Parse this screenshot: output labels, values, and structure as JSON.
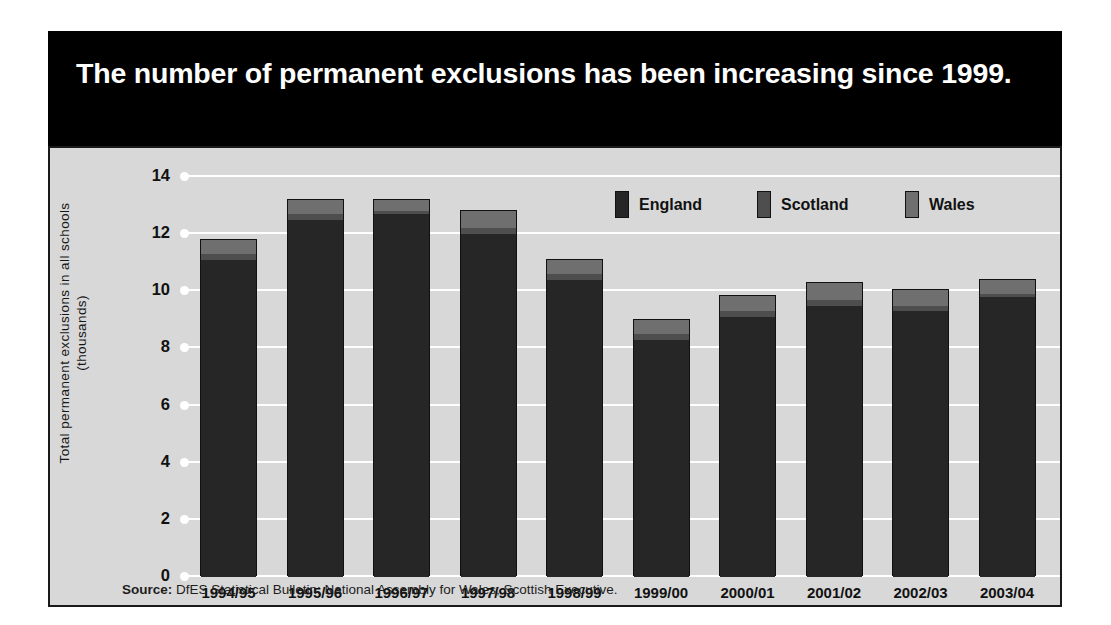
{
  "title": "The number of permanent exclusions has been increasing since 1999.",
  "source_label": "Source:",
  "source_text": " DfES Statistical Bulletin; National Assembly for Wales; Scottish Executive.",
  "legend": {
    "items": [
      {
        "label": "England",
        "color": "#262626",
        "swatch_name": "legend-swatch-england"
      },
      {
        "label": "Scotland",
        "color": "#4e4e4e",
        "swatch_name": "legend-swatch-scotland"
      },
      {
        "label": "Wales",
        "color": "#6f6f6f",
        "swatch_name": "legend-swatch-wales"
      }
    ]
  },
  "colors": {
    "title_band": "#000000",
    "panel_background": "#d8d8d8",
    "gridline": "#ffffff",
    "england": "#262626",
    "scotland": "#4e4e4e",
    "wales": "#6f6f6f",
    "outline": "#111111"
  },
  "chart_data": {
    "type": "bar",
    "title": "The number of permanent exclusions has been increasing since 1999.",
    "subtitle": "",
    "xlabel": "",
    "ylabel": "Total permanent exclusions in all schools (thousands)",
    "ylabel_line1": "Total permanent exclusions in all schools",
    "ylabel_line2": "(thousands)",
    "stacked": true,
    "grid": true,
    "legend_position": "top-right",
    "ylim": [
      0,
      14
    ],
    "yticks": [
      0,
      2,
      4,
      6,
      8,
      10,
      12,
      14
    ],
    "ytick_labels": [
      "0",
      "2",
      "4",
      "6",
      "8",
      "10",
      "12",
      "14"
    ],
    "categories": [
      "1994/95",
      "1995/96",
      "1996/97",
      "1997/98",
      "1998/99",
      "1999/00",
      "2000/01",
      "2001/02",
      "2002/03",
      "2003/04"
    ],
    "series": [
      {
        "name": "England",
        "color": "#262626",
        "values": [
          11.1,
          12.5,
          12.7,
          12.0,
          10.4,
          8.3,
          9.1,
          9.5,
          9.3,
          9.8
        ]
      },
      {
        "name": "Scotland",
        "color": "#4e4e4e",
        "values": [
          0.2,
          0.2,
          0.1,
          0.2,
          0.2,
          0.2,
          0.2,
          0.2,
          0.2,
          0.1
        ]
      },
      {
        "name": "Wales",
        "color": "#6f6f6f",
        "values": [
          0.5,
          0.5,
          0.4,
          0.6,
          0.5,
          0.5,
          0.55,
          0.6,
          0.55,
          0.5
        ]
      }
    ],
    "totals": [
      11.8,
      13.2,
      13.2,
      12.8,
      11.1,
      9.0,
      9.85,
      10.3,
      10.05,
      10.4
    ]
  }
}
